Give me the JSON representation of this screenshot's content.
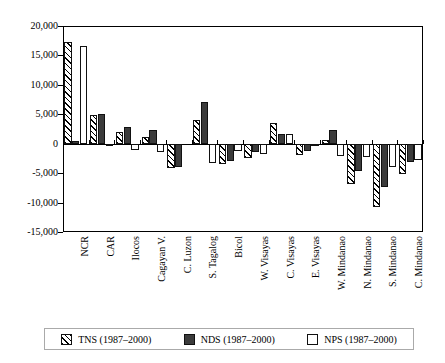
{
  "chart_data": {
    "type": "bar",
    "title": "",
    "subtitle": "",
    "xlabel": "",
    "ylabel": "",
    "ylim": [
      -15000,
      20000
    ],
    "ytick_labels": [
      "20,000",
      "15,000",
      "10,000",
      "5,000",
      "0",
      "-5,000",
      "-10,000",
      "-15,000"
    ],
    "ytick_values": [
      20000,
      15000,
      10000,
      5000,
      0,
      -5000,
      -10000,
      -15000
    ],
    "grid": false,
    "legend_position": "bottom",
    "categories": [
      "NCR",
      "CAR",
      "Ilocos",
      "Cagayan V.",
      "C. Luzon",
      "S. Tagalog",
      "Bicol",
      "W. Visayas",
      "C. Visayas",
      "E. Visayas",
      "W. Mindanao",
      "N. Mindanao",
      "S. Mindanao",
      "C. Mindanao"
    ],
    "series": [
      {
        "name": "TNS (1987-2000)",
        "pattern": "diagonal-hatch",
        "values": [
          17200,
          4800,
          2000,
          1200,
          -4200,
          4100,
          -3400,
          -2400,
          3500,
          -2000,
          700,
          -6900,
          -10700,
          -5200
        ]
      },
      {
        "name": "NDS (1987-2000)",
        "pattern": "solid-dark",
        "values": [
          500,
          5000,
          2900,
          2400,
          -4000,
          7100,
          -2900,
          -1400,
          1700,
          -1300,
          2300,
          -4700,
          -7400,
          -3100
        ]
      },
      {
        "name": "NPS (1987-2000)",
        "pattern": "white",
        "values": [
          16600,
          -300,
          -1000,
          -1400,
          0,
          -3300,
          -1300,
          -1700,
          1700,
          -200,
          -2100,
          -2300,
          -4000,
          -2800
        ]
      }
    ]
  },
  "legend": {
    "items": [
      {
        "label": "TNS (1987–2000)",
        "swatch": "diagonal-hatch-swatch"
      },
      {
        "label": "NDS (1987–2000)",
        "swatch": "solid-dark-swatch"
      },
      {
        "label": "NPS (1987–2000)",
        "swatch": "white-swatch"
      }
    ]
  },
  "colors": {
    "axis": "#000000",
    "series_nds": "#3b3b3b",
    "series_nps": "#ffffff",
    "series_tns_hatch": "#000000",
    "background": "#ffffff"
  }
}
